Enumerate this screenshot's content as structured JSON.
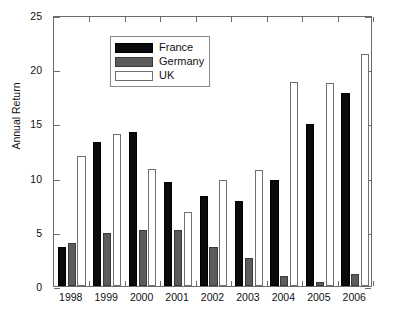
{
  "chart_data": {
    "type": "bar",
    "title": "",
    "xlabel": "",
    "ylabel": "Annual Return",
    "ylim": [
      0,
      25
    ],
    "yticks": [
      0,
      5,
      10,
      15,
      20,
      25
    ],
    "grid": false,
    "legend_position": "top-left",
    "categories": [
      "1998",
      "1999",
      "2000",
      "2001",
      "2002",
      "2003",
      "2004",
      "2005",
      "2006"
    ],
    "series": [
      {
        "name": "France",
        "color": "#0a0a0a",
        "values": [
          3.6,
          13.3,
          14.2,
          9.6,
          8.3,
          7.8,
          9.8,
          14.9,
          17.8
        ]
      },
      {
        "name": "Germany",
        "color": "#5c5c5c",
        "values": [
          4.0,
          4.9,
          5.2,
          5.2,
          3.6,
          2.6,
          0.9,
          0.4,
          1.1
        ]
      },
      {
        "name": "UK",
        "color": "#ffffff",
        "values": [
          12.0,
          14.0,
          10.8,
          6.8,
          9.8,
          10.7,
          18.8,
          18.7,
          21.4
        ]
      }
    ]
  },
  "axis": {
    "y_title": "Annual Return"
  }
}
